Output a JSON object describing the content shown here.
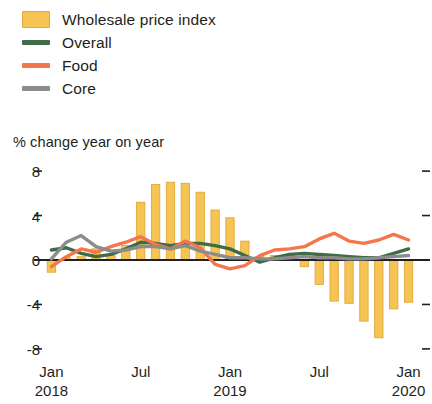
{
  "legend": {
    "items": [
      {
        "label": "Wholesale price index",
        "key": "box",
        "color": "#F6C453",
        "icon": "legend-swatch-box"
      },
      {
        "label": "Overall",
        "key": "line",
        "color": "#3F6B47",
        "icon": "legend-swatch-line"
      },
      {
        "label": "Food",
        "key": "line",
        "color": "#F4764B",
        "icon": "legend-swatch-line"
      },
      {
        "label": "Core",
        "key": "line",
        "color": "#8C8C8C",
        "icon": "legend-swatch-line"
      }
    ]
  },
  "subtitle": "% change year on year",
  "colors": {
    "bars": "#F6C453",
    "bars_edge": "#E0A93B",
    "overall": "#3F6B47",
    "food": "#F4764B",
    "core": "#8C8C8C",
    "axis": "#231f20",
    "background": "#FFFFFF"
  },
  "chart_data": {
    "type": "bar",
    "title": "",
    "subtitle": "% change year on year",
    "xlabel": "",
    "ylabel": "% change year on year",
    "ylim": [
      -9,
      9
    ],
    "yticks": [
      8,
      4,
      0,
      -4,
      -8
    ],
    "ytick_labels": [
      "8",
      "4",
      "0",
      "-4",
      "-8"
    ],
    "grid": false,
    "legend_position": "top-left",
    "x": [
      "Jan 2018",
      "Feb 2018",
      "Mar 2018",
      "Apr 2018",
      "May 2018",
      "Jun 2018",
      "Jul 2018",
      "Aug 2018",
      "Sep 2018",
      "Oct 2018",
      "Nov 2018",
      "Dec 2018",
      "Jan 2019",
      "Feb 2019",
      "Mar 2019",
      "Apr 2019",
      "May 2019",
      "Jun 2019",
      "Jul 2019",
      "Aug 2019",
      "Sep 2019",
      "Oct 2019",
      "Nov 2019",
      "Dec 2019",
      "Jan 2020"
    ],
    "xtick_labels": [
      {
        "label": "Jan",
        "year": "2018",
        "index": 0
      },
      {
        "label": "Jul",
        "year": "",
        "index": 6
      },
      {
        "label": "Jan",
        "year": "2019",
        "index": 12
      },
      {
        "label": "Jul",
        "year": "",
        "index": 18
      },
      {
        "label": "Jan",
        "year": "2020",
        "index": 24
      }
    ],
    "series": [
      {
        "name": "Wholesale price index",
        "type": "bar",
        "color": "#F6C453",
        "values": [
          -1.1,
          0.2,
          0.3,
          1.0,
          0.4,
          1.3,
          5.2,
          6.8,
          7.0,
          6.9,
          6.1,
          4.5,
          3.8,
          1.7,
          0.3,
          0.4,
          0.3,
          -0.6,
          -2.2,
          -3.7,
          -3.9,
          -5.5,
          -7.0,
          -4.4,
          -3.8
        ]
      },
      {
        "name": "Overall",
        "type": "line",
        "color": "#3F6B47",
        "values": [
          0.9,
          1.1,
          0.6,
          0.3,
          0.5,
          1.0,
          1.6,
          1.5,
          1.3,
          1.5,
          1.5,
          1.3,
          1.0,
          0.4,
          -0.2,
          0.2,
          0.5,
          0.6,
          0.5,
          0.4,
          0.3,
          0.2,
          0.2,
          0.6,
          1.0
        ]
      },
      {
        "name": "Food",
        "type": "line",
        "color": "#F4764B",
        "values": [
          -0.6,
          0.3,
          1.0,
          0.7,
          1.2,
          1.6,
          2.1,
          1.4,
          1.0,
          1.7,
          1.1,
          -0.4,
          -0.8,
          -0.5,
          0.4,
          0.9,
          1.0,
          1.2,
          1.9,
          2.4,
          1.7,
          1.5,
          1.8,
          2.3,
          1.8
        ]
      },
      {
        "name": "Core",
        "type": "line",
        "color": "#8C8C8C",
        "values": [
          0.1,
          1.6,
          2.2,
          1.2,
          0.8,
          0.9,
          1.2,
          1.2,
          1.0,
          1.3,
          0.8,
          0.5,
          0.2,
          0.2,
          0.1,
          0.1,
          0.2,
          0.3,
          0.2,
          0.2,
          0.1,
          0.1,
          0.2,
          0.3,
          0.4
        ]
      }
    ]
  }
}
